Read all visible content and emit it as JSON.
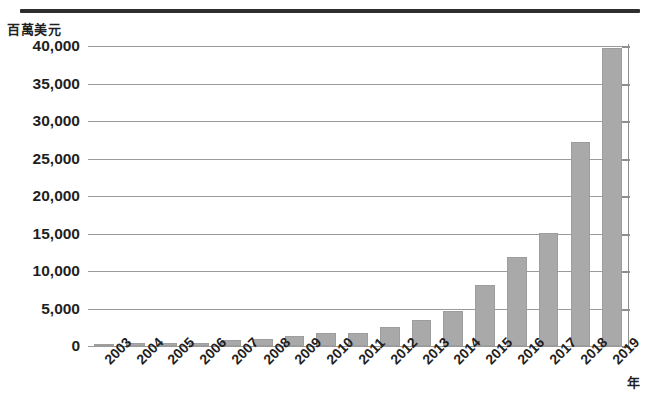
{
  "chart_data": {
    "type": "bar",
    "title": "",
    "subtitle": "",
    "xlabel": "年",
    "ylabel": "百萬美元",
    "categories": [
      "2003",
      "2004",
      "2005",
      "2006",
      "2007",
      "2008",
      "2009",
      "2010",
      "2011",
      "2012",
      "2013",
      "2014",
      "2015",
      "2016",
      "2017",
      "2018",
      "2019"
    ],
    "values": [
      300,
      420,
      430,
      440,
      800,
      900,
      1300,
      1700,
      1700,
      2500,
      3500,
      4700,
      8100,
      11900,
      15100,
      27200,
      39800
    ],
    "series": [
      {
        "name": "百萬美元",
        "values": [
          300,
          420,
          430,
          440,
          800,
          900,
          1300,
          1700,
          1700,
          2500,
          3500,
          4700,
          8100,
          11900,
          15100,
          27200,
          39800
        ]
      }
    ],
    "ylim": [
      0,
      40000
    ],
    "ytick_values": [
      0,
      5000,
      10000,
      15000,
      20000,
      25000,
      30000,
      35000,
      40000
    ],
    "ytick_labels": [
      "0",
      "5,000",
      "10,000",
      "15,000",
      "20,000",
      "25,000",
      "30,000",
      "35,000",
      "40,000"
    ],
    "grid": true,
    "grid_axis": "y",
    "legend": false,
    "legend_position": "none",
    "bar_color": "#a9a9a9",
    "grid_color": "#9a9a9a",
    "axis_color": "#8f8f8f",
    "text_color": "#1f1f1f",
    "rule_color": "#2e2e2e",
    "background": "#ffffff",
    "xtick_rotation": -45
  }
}
